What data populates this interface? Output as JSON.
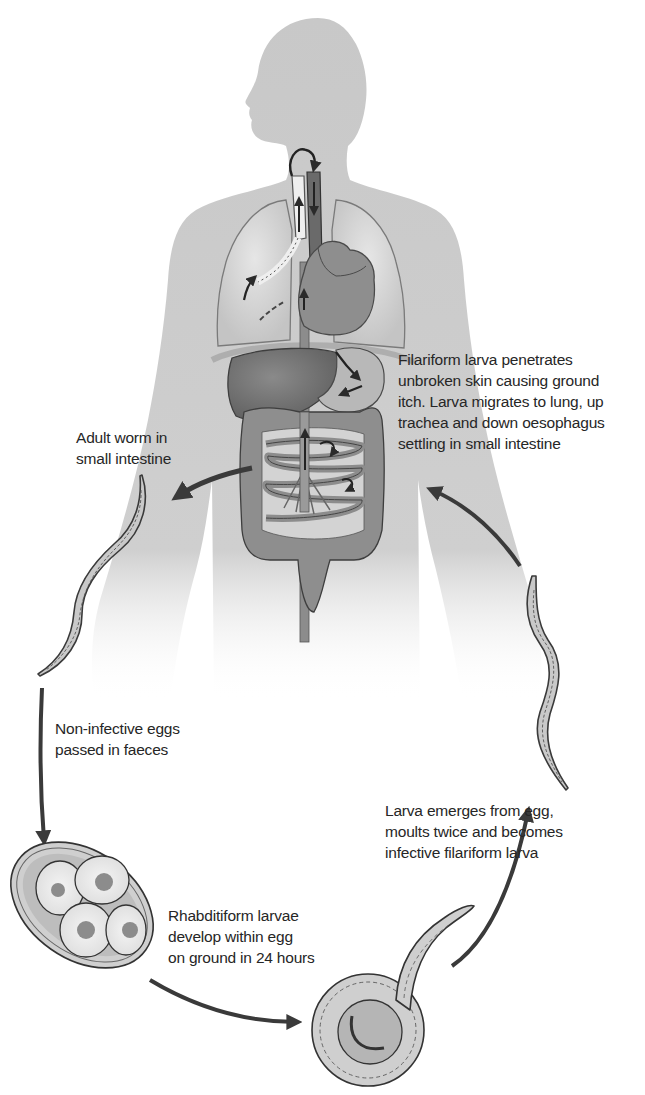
{
  "diagram": {
    "colors": {
      "body_silhouette": "#c9c9c9",
      "organ_dark": "#6e6e6e",
      "organ_mid": "#8c8c8c",
      "organ_light": "#b5b5b5",
      "lung": "#d6d6d6",
      "arrow": "#3a3a3a",
      "text": "#262626",
      "background": "#ffffff"
    },
    "labels": {
      "filariform_penetrates": {
        "lines": [
          "Filariform larva penetrates",
          "unbroken skin causing ground",
          "itch. Larva migrates to lung, up",
          "trachea and down oesophagus",
          "settling in small intestine"
        ]
      },
      "adult_worm": {
        "lines": [
          "Adult worm in",
          "small intestine"
        ]
      },
      "non_infective_eggs": {
        "lines": [
          "Non-infective eggs",
          "passed in faeces"
        ]
      },
      "rhabditiform": {
        "lines": [
          "Rhabditiform larvae",
          "develop within egg",
          "on ground in 24 hours"
        ]
      },
      "larva_emerges": {
        "lines": [
          "Larva emerges from egg,",
          "moults twice and becomes",
          "infective filariform larva"
        ]
      }
    },
    "stages": [
      {
        "id": "adult-worm",
        "name": "Adult worm"
      },
      {
        "id": "egg",
        "name": "Non-infective egg"
      },
      {
        "id": "rhabditiform-larva",
        "name": "Rhabditiform larva"
      },
      {
        "id": "filariform-larva",
        "name": "Filariform larva"
      }
    ]
  }
}
